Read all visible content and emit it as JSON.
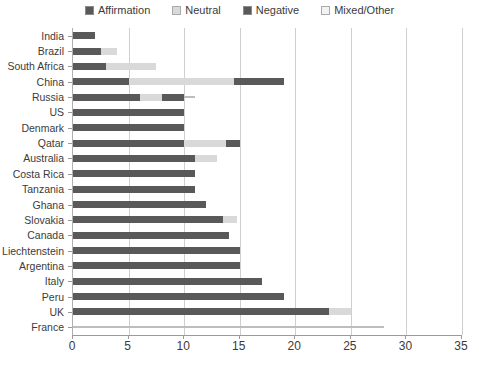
{
  "chart_data": {
    "type": "bar",
    "orientation": "horizontal",
    "stacked": true,
    "title": "",
    "xlabel": "",
    "ylabel": "",
    "xlim": [
      0,
      35
    ],
    "xticks": [
      0,
      5,
      10,
      15,
      20,
      25,
      30,
      35
    ],
    "grid": "vertical",
    "legend_position": "top-center",
    "legend": [
      "Affirmation",
      "Neutral",
      "Negative",
      "Mixed/Other"
    ],
    "series": [
      {
        "name": "Affirmation",
        "color": "#595959",
        "values": [
          2,
          2.5,
          3,
          5,
          6,
          10,
          10,
          10,
          11,
          11,
          11,
          12,
          13.5,
          14,
          15,
          15,
          17,
          19,
          23,
          0
        ]
      },
      {
        "name": "Neutral",
        "color": "#d9d9d9",
        "values": [
          0,
          1.5,
          4.5,
          9.5,
          2,
          0,
          0,
          3.8,
          2,
          0,
          0,
          0,
          1.3,
          0,
          0,
          0,
          0,
          0,
          2,
          0
        ]
      },
      {
        "name": "Negative",
        "color": "#595959",
        "values": [
          0,
          0,
          0,
          4.5,
          2,
          0,
          0,
          1.2,
          0,
          0,
          0,
          0,
          0,
          0,
          0,
          0,
          0,
          0,
          0,
          0
        ]
      },
      {
        "name": "Mixed/Other",
        "color": "#f2f2f2",
        "values": [
          0,
          0,
          0,
          0,
          1,
          0,
          0,
          0,
          0,
          0,
          0,
          0,
          0,
          0,
          0,
          0,
          0,
          0,
          0,
          28
        ]
      }
    ],
    "categories": [
      "India",
      "Brazil",
      "South Africa",
      "China",
      "Russia",
      "US",
      "Denmark",
      "Qatar",
      "Australia",
      "Costa Rica",
      "Tanzania",
      "Ghana",
      "Slovakia",
      "Canada",
      "Liechtenstein",
      "Argentina",
      "Italy",
      "Peru",
      "UK",
      "France"
    ],
    "totals": [
      2,
      4,
      7.5,
      19,
      11,
      10,
      10,
      15,
      13,
      11,
      11,
      12,
      14.8,
      14,
      15,
      15,
      17,
      19,
      25,
      28
    ]
  },
  "colors": {
    "affirmation": "#595959",
    "neutral": "#d9d9d9",
    "negative": "#595959",
    "mixed_other": "#f2f2f2",
    "gridline": "#cfcfcf",
    "axis": "#9a9a9a",
    "text": "#3b3b3b",
    "background": "#ffffff"
  }
}
